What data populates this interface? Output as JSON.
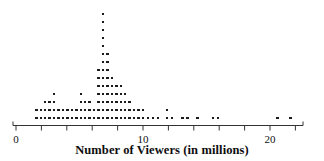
{
  "chart_data": {
    "type": "dotplot",
    "title": "",
    "xlabel": "Number of Viewers (in millions)",
    "ylabel": "",
    "xlim": [
      0,
      22.6
    ],
    "grid": false,
    "legend": false,
    "axis_ticks": [
      0,
      2,
      4,
      6,
      8,
      10,
      12,
      14,
      16,
      18,
      20,
      22
    ],
    "tick_labels": [
      {
        "value": 0,
        "text": "0"
      },
      {
        "value": 10,
        "text": "10"
      },
      {
        "value": 20,
        "text": "20"
      }
    ],
    "dot_color": "#1b1b1b",
    "axis_color": "#333333",
    "x_values": [
      1.6,
      1.6,
      1.95,
      1.95,
      2.3,
      2.3,
      2.3,
      2.65,
      2.65,
      2.65,
      3.0,
      3.0,
      3.0,
      3.0,
      3.35,
      3.35,
      3.7,
      3.7,
      4.05,
      4.4,
      4.75,
      5.1,
      5.1,
      5.45,
      5.45,
      5.45,
      5.8,
      5.8,
      5.8,
      6.15,
      6.15,
      6.5,
      6.5,
      6.5,
      6.5,
      6.85,
      6.85,
      6.85,
      6.85,
      6.85,
      6.85,
      6.85,
      6.85,
      6.85,
      6.85,
      6.85,
      6.85,
      6.85,
      6.85,
      7.2,
      7.2,
      7.2,
      7.2,
      7.2,
      7.55,
      7.55,
      7.55,
      7.55,
      7.55,
      7.9,
      7.9,
      7.9,
      7.9,
      8.25,
      8.25,
      8.25,
      8.25,
      8.6,
      8.6,
      8.95,
      8.95,
      9.3,
      9.65,
      10.0,
      10.35,
      10.7,
      11.5,
      11.5,
      11.85,
      12.2,
      13.0,
      13.4,
      14.2,
      15.4,
      15.8,
      20.6,
      21.6
    ],
    "columns": [
      {
        "x": 1.6,
        "count": 2
      },
      {
        "x": 1.95,
        "count": 2
      },
      {
        "x": 2.3,
        "count": 3
      },
      {
        "x": 2.65,
        "count": 3
      },
      {
        "x": 3.0,
        "count": 4
      },
      {
        "x": 3.35,
        "count": 2
      },
      {
        "x": 3.7,
        "count": 2
      },
      {
        "x": 4.05,
        "count": 2
      },
      {
        "x": 4.4,
        "count": 2
      },
      {
        "x": 4.75,
        "count": 2
      },
      {
        "x": 5.1,
        "count": 4
      },
      {
        "x": 5.45,
        "count": 3
      },
      {
        "x": 5.8,
        "count": 3
      },
      {
        "x": 6.15,
        "count": 2
      },
      {
        "x": 6.5,
        "count": 7
      },
      {
        "x": 6.85,
        "count": 14
      },
      {
        "x": 7.2,
        "count": 9
      },
      {
        "x": 7.55,
        "count": 6
      },
      {
        "x": 7.9,
        "count": 5
      },
      {
        "x": 8.25,
        "count": 5
      },
      {
        "x": 8.6,
        "count": 4
      },
      {
        "x": 8.95,
        "count": 3
      },
      {
        "x": 9.3,
        "count": 2
      },
      {
        "x": 9.65,
        "count": 2
      },
      {
        "x": 10.0,
        "count": 2
      },
      {
        "x": 10.4,
        "count": 1
      },
      {
        "x": 10.8,
        "count": 1
      },
      {
        "x": 11.2,
        "count": 1
      },
      {
        "x": 11.9,
        "count": 2
      },
      {
        "x": 12.3,
        "count": 1
      },
      {
        "x": 13.1,
        "count": 1
      },
      {
        "x": 13.5,
        "count": 1
      },
      {
        "x": 14.3,
        "count": 1
      },
      {
        "x": 15.5,
        "count": 1
      },
      {
        "x": 15.9,
        "count": 1
      },
      {
        "x": 20.6,
        "count": 1
      },
      {
        "x": 21.6,
        "count": 1
      }
    ]
  }
}
